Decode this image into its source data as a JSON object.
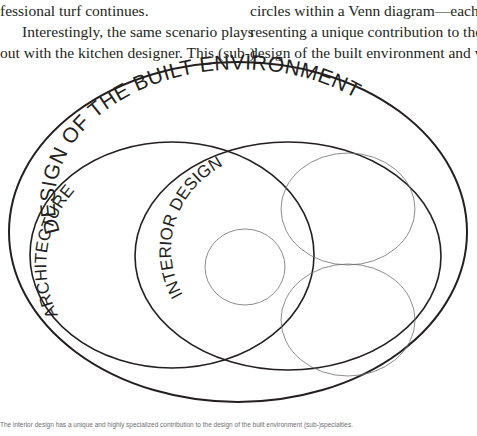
{
  "body_text": {
    "left_column": [
      "fessional turf continues.",
      "Interestingly, the same scenario plays",
      "out with the kitchen designer. This (sub-)"
    ],
    "right_column": [
      "circles within a Venn diagram—each rep-",
      "resenting a unique contribution to the",
      "design of the built environment and vary-"
    ]
  },
  "figure": {
    "labels": {
      "outer": "DESIGN OF THE BUILT ENVIRONMENT",
      "architecture": "ARCHITECTURE",
      "interior_design": "INTERIOR DESIGN"
    },
    "colors": {
      "stroke": "#231f20",
      "thin_stroke": "#6d6e71",
      "text": "#231f20"
    },
    "shapes": {
      "outer": {
        "cx": 238,
        "cy": 182,
        "rx": 229,
        "ry": 170
      },
      "architecture": {
        "cx": 172,
        "cy": 205,
        "rx": 142,
        "ry": 113
      },
      "interior_design": {
        "cx": 288,
        "cy": 206,
        "rx": 153,
        "ry": 114
      },
      "inner_small": {
        "cx": 245,
        "cy": 217,
        "rx": 40,
        "ry": 38
      },
      "upper_right": {
        "cx": 348,
        "cy": 159,
        "rx": 67,
        "ry": 56
      },
      "lower_right": {
        "cx": 348,
        "cy": 270,
        "rx": 67,
        "ry": 56
      }
    }
  },
  "caption": {
    "label": "",
    "text": "The interior design has a unique and highly specialized contribution to the design of the built environment (sub-)specialties."
  }
}
